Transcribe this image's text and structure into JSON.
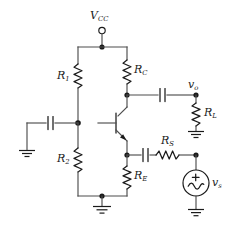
{
  "diagram": {
    "kind": "circuit-schematic",
    "colors": {
      "background": "#ffffff",
      "wire": "#4d4d4d",
      "component": "#1a1a1a",
      "label": "#1a1a1a"
    }
  },
  "labels": {
    "vcc": {
      "symbol": "V",
      "subscript": "CC",
      "name": "supply-voltage"
    },
    "r1": {
      "symbol": "R",
      "subscript": "1",
      "name": "bias-resistor-upper"
    },
    "r2": {
      "symbol": "R",
      "subscript": "2",
      "name": "bias-resistor-lower"
    },
    "rc": {
      "symbol": "R",
      "subscript": "C",
      "name": "collector-resistor"
    },
    "re": {
      "symbol": "R",
      "subscript": "E",
      "name": "emitter-resistor"
    },
    "rl": {
      "symbol": "R",
      "subscript": "L",
      "name": "load-resistor"
    },
    "rs": {
      "symbol": "R",
      "subscript": "S",
      "name": "source-resistor"
    },
    "vo": {
      "symbol": "v",
      "subscript": "o",
      "name": "output-voltage-node"
    },
    "vs": {
      "symbol": "v",
      "subscript": "s",
      "name": "source-voltage"
    },
    "source_polarity": "+"
  },
  "components": [
    {
      "id": "vcc-terminal",
      "type": "terminal",
      "label": "V_CC"
    },
    {
      "id": "r1",
      "type": "resistor",
      "orientation": "vertical",
      "label": "R_1"
    },
    {
      "id": "r2",
      "type": "resistor",
      "orientation": "vertical",
      "label": "R_2"
    },
    {
      "id": "rc",
      "type": "resistor",
      "orientation": "vertical",
      "label": "R_C"
    },
    {
      "id": "re",
      "type": "resistor",
      "orientation": "vertical",
      "label": "R_E"
    },
    {
      "id": "rl",
      "type": "resistor",
      "orientation": "vertical",
      "label": "R_L"
    },
    {
      "id": "rs",
      "type": "resistor",
      "orientation": "horizontal",
      "label": "R_S"
    },
    {
      "id": "cin",
      "type": "capacitor",
      "orientation": "vertical-plates",
      "label": ""
    },
    {
      "id": "cout",
      "type": "capacitor",
      "orientation": "vertical-plates",
      "label": ""
    },
    {
      "id": "cs",
      "type": "capacitor",
      "orientation": "vertical-plates",
      "label": ""
    },
    {
      "id": "q1",
      "type": "npn-transistor",
      "label": ""
    },
    {
      "id": "vs",
      "type": "ac-source",
      "label": "v_s",
      "polarity": "+"
    },
    {
      "id": "gnd-input",
      "type": "ground",
      "label": ""
    },
    {
      "id": "gnd-load",
      "type": "ground",
      "label": ""
    },
    {
      "id": "gnd-source",
      "type": "ground",
      "label": ""
    },
    {
      "id": "gnd-rail",
      "type": "ground",
      "label": ""
    }
  ]
}
